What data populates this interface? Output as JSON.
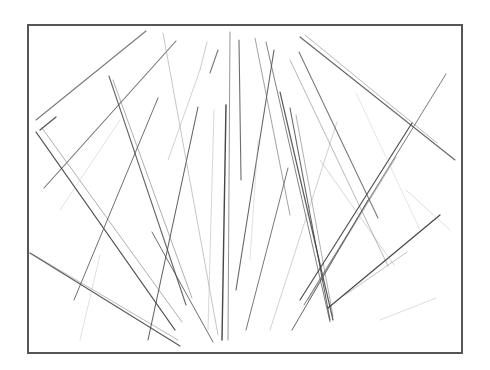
{
  "image": {
    "width": 490,
    "height": 370,
    "background": "#ffffff",
    "description": "Pencil-style drawing of many scattered straight lines (like sticks/straws) radiating and crossing inside a rectangular frame"
  },
  "frame": {
    "x": 28,
    "y": 25,
    "width": 434,
    "height": 328,
    "stroke": "#555555",
    "stroke_width": 2
  },
  "strokes": [
    {
      "x1": 36,
      "y1": 120,
      "x2": 146,
      "y2": 31,
      "color": "#6a6a6a",
      "w": 1.1,
      "o": 0.9
    },
    {
      "x1": 40,
      "y1": 130,
      "x2": 56,
      "y2": 117,
      "color": "#444444",
      "w": 1.3,
      "o": 0.9
    },
    {
      "x1": 44,
      "y1": 188,
      "x2": 176,
      "y2": 41,
      "color": "#5a5a5a",
      "w": 1.1,
      "o": 0.85
    },
    {
      "x1": 36,
      "y1": 132,
      "x2": 175,
      "y2": 330,
      "color": "#3e3e3e",
      "w": 1.3,
      "o": 0.9
    },
    {
      "x1": 42,
      "y1": 128,
      "x2": 182,
      "y2": 322,
      "color": "#6a6a6a",
      "w": 0.9,
      "o": 0.6
    },
    {
      "x1": 109,
      "y1": 76,
      "x2": 186,
      "y2": 305,
      "color": "#4a4a4a",
      "w": 1.1,
      "o": 0.85
    },
    {
      "x1": 113,
      "y1": 80,
      "x2": 192,
      "y2": 298,
      "color": "#6a6a6a",
      "w": 0.9,
      "o": 0.6
    },
    {
      "x1": 74,
      "y1": 300,
      "x2": 158,
      "y2": 98,
      "color": "#555555",
      "w": 1.0,
      "o": 0.85
    },
    {
      "x1": 30,
      "y1": 253,
      "x2": 180,
      "y2": 346,
      "color": "#4a4a4a",
      "w": 1.2,
      "o": 0.9
    },
    {
      "x1": 34,
      "y1": 255,
      "x2": 178,
      "y2": 340,
      "color": "#7a7a7a",
      "w": 0.9,
      "o": 0.6
    },
    {
      "x1": 148,
      "y1": 340,
      "x2": 198,
      "y2": 107,
      "color": "#4a4a4a",
      "w": 1.1,
      "o": 0.85
    },
    {
      "x1": 163,
      "y1": 33,
      "x2": 218,
      "y2": 335,
      "color": "#8a8a8a",
      "w": 0.9,
      "o": 0.55
    },
    {
      "x1": 168,
      "y1": 160,
      "x2": 200,
      "y2": 70,
      "color": "#9a9a9a",
      "w": 0.9,
      "o": 0.5
    },
    {
      "x1": 207,
      "y1": 42,
      "x2": 200,
      "y2": 70,
      "color": "#8a8a8a",
      "w": 0.9,
      "o": 0.5
    },
    {
      "x1": 210,
      "y1": 73,
      "x2": 218,
      "y2": 50,
      "color": "#555555",
      "w": 1.1,
      "o": 0.8
    },
    {
      "x1": 230,
      "y1": 32,
      "x2": 228,
      "y2": 340,
      "color": "#6a6a6a",
      "w": 1.0,
      "o": 0.7
    },
    {
      "x1": 226,
      "y1": 105,
      "x2": 222,
      "y2": 340,
      "color": "#333333",
      "w": 1.4,
      "o": 0.9
    },
    {
      "x1": 239,
      "y1": 40,
      "x2": 241,
      "y2": 180,
      "color": "#4a4a4a",
      "w": 1.1,
      "o": 0.8
    },
    {
      "x1": 152,
      "y1": 232,
      "x2": 213,
      "y2": 342,
      "color": "#4a4a4a",
      "w": 1.0,
      "o": 0.8
    },
    {
      "x1": 236,
      "y1": 290,
      "x2": 274,
      "y2": 50,
      "color": "#4a4a4a",
      "w": 1.1,
      "o": 0.85
    },
    {
      "x1": 246,
      "y1": 330,
      "x2": 288,
      "y2": 168,
      "color": "#555555",
      "w": 1.0,
      "o": 0.8
    },
    {
      "x1": 255,
      "y1": 38,
      "x2": 290,
      "y2": 215,
      "color": "#6a6a6a",
      "w": 0.9,
      "o": 0.7
    },
    {
      "x1": 266,
      "y1": 42,
      "x2": 330,
      "y2": 322,
      "color": "#5a5a5a",
      "w": 1.0,
      "o": 0.75
    },
    {
      "x1": 290,
      "y1": 108,
      "x2": 330,
      "y2": 320,
      "color": "#4a4a4a",
      "w": 1.1,
      "o": 0.85
    },
    {
      "x1": 296,
      "y1": 115,
      "x2": 333,
      "y2": 316,
      "color": "#6a6a6a",
      "w": 0.9,
      "o": 0.6
    },
    {
      "x1": 280,
      "y1": 92,
      "x2": 333,
      "y2": 320,
      "color": "#3e3e3e",
      "w": 1.2,
      "o": 0.85
    },
    {
      "x1": 270,
      "y1": 330,
      "x2": 337,
      "y2": 122,
      "color": "#9a9a9a",
      "w": 0.9,
      "o": 0.5
    },
    {
      "x1": 290,
      "y1": 60,
      "x2": 388,
      "y2": 266,
      "color": "#7a7a7a",
      "w": 0.9,
      "o": 0.6
    },
    {
      "x1": 299,
      "y1": 52,
      "x2": 378,
      "y2": 218,
      "color": "#5a5a5a",
      "w": 1.1,
      "o": 0.8
    },
    {
      "x1": 300,
      "y1": 37,
      "x2": 455,
      "y2": 160,
      "color": "#4a4a4a",
      "w": 1.1,
      "o": 0.85
    },
    {
      "x1": 305,
      "y1": 35,
      "x2": 437,
      "y2": 143,
      "color": "#7a7a7a",
      "w": 0.9,
      "o": 0.6
    },
    {
      "x1": 292,
      "y1": 330,
      "x2": 368,
      "y2": 200,
      "color": "#4a4a4a",
      "w": 1.0,
      "o": 0.85
    },
    {
      "x1": 300,
      "y1": 300,
      "x2": 412,
      "y2": 123,
      "color": "#3e3e3e",
      "w": 1.2,
      "o": 0.9
    },
    {
      "x1": 304,
      "y1": 305,
      "x2": 446,
      "y2": 74,
      "color": "#5a5a5a",
      "w": 1.0,
      "o": 0.8
    },
    {
      "x1": 308,
      "y1": 300,
      "x2": 396,
      "y2": 157,
      "color": "#6a6a6a",
      "w": 0.9,
      "o": 0.6
    },
    {
      "x1": 328,
      "y1": 308,
      "x2": 440,
      "y2": 215,
      "color": "#333333",
      "w": 1.2,
      "o": 0.9
    },
    {
      "x1": 345,
      "y1": 295,
      "x2": 407,
      "y2": 252,
      "color": "#7a7a7a",
      "w": 0.9,
      "o": 0.5
    },
    {
      "x1": 320,
      "y1": 160,
      "x2": 394,
      "y2": 265,
      "color": "#9a9a9a",
      "w": 0.9,
      "o": 0.45
    },
    {
      "x1": 380,
      "y1": 320,
      "x2": 436,
      "y2": 298,
      "color": "#aaaaaa",
      "w": 0.9,
      "o": 0.45
    },
    {
      "x1": 406,
      "y1": 190,
      "x2": 450,
      "y2": 230,
      "color": "#aaaaaa",
      "w": 0.9,
      "o": 0.45
    },
    {
      "x1": 356,
      "y1": 93,
      "x2": 420,
      "y2": 230,
      "color": "#aaaaaa",
      "w": 0.8,
      "o": 0.4
    },
    {
      "x1": 60,
      "y1": 210,
      "x2": 120,
      "y2": 120,
      "color": "#aaaaaa",
      "w": 0.8,
      "o": 0.45
    },
    {
      "x1": 80,
      "y1": 340,
      "x2": 100,
      "y2": 255,
      "color": "#aaaaaa",
      "w": 0.8,
      "o": 0.45
    },
    {
      "x1": 214,
      "y1": 110,
      "x2": 208,
      "y2": 330,
      "color": "#9a9a9a",
      "w": 0.8,
      "o": 0.5
    },
    {
      "x1": 258,
      "y1": 140,
      "x2": 250,
      "y2": 260,
      "color": "#aaaaaa",
      "w": 0.8,
      "o": 0.45
    }
  ]
}
